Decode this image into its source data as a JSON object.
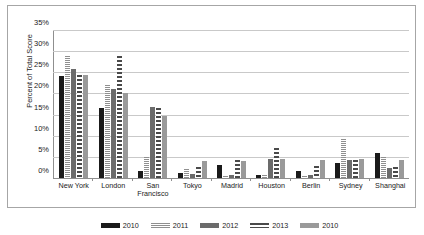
{
  "chart_data": {
    "type": "bar",
    "title": "",
    "xlabel": "",
    "ylabel": "Percent of Total Score",
    "ylim": [
      0,
      35
    ],
    "ytick_values": [
      0,
      5,
      10,
      15,
      20,
      25,
      30,
      35
    ],
    "ytick_labels": [
      "0%",
      "5%",
      "10%",
      "15%",
      "20%",
      "25%",
      "30%",
      "35%"
    ],
    "grid": true,
    "legend_position": "bottom",
    "categories": [
      "New York",
      "London",
      "San Francisco",
      "Tokyo",
      "Madrid",
      "Houston",
      "Berlin",
      "Sydney",
      "Shanghai"
    ],
    "series": [
      {
        "name": "2010",
        "color": "#1a1a1a",
        "pattern": "solid-black",
        "values": [
          24.2,
          16.7,
          1.6,
          1.3,
          3.0,
          0.8,
          1.6,
          3.5,
          6.0
        ]
      },
      {
        "name": "2011",
        "color": "#8f8f8f",
        "pattern": "fine-horizontal-hatch",
        "values": [
          29.0,
          22.1,
          5.0,
          2.2,
          0.4,
          0.6,
          0.5,
          9.4,
          5.1
        ]
      },
      {
        "name": "2012",
        "color": "#6b6b6b",
        "pattern": "solid-gray",
        "values": [
          26.0,
          21.1,
          17.0,
          1.0,
          0.6,
          4.6,
          0.6,
          4.2,
          2.5
        ]
      },
      {
        "name": "2013",
        "color": "#4a4a4a",
        "pattern": "dashed-hatch",
        "values": [
          24.6,
          29.0,
          16.7,
          2.7,
          4.3,
          7.2,
          2.8,
          4.3,
          2.6
        ]
      },
      {
        "name": "2010",
        "color": "#9a9a9a",
        "pattern": "solid-lightgray",
        "values": [
          24.6,
          20.2,
          14.8,
          4.1,
          4.1,
          4.6,
          4.3,
          4.6,
          4.2
        ]
      }
    ]
  },
  "axis": {
    "y_title": "Percent of Total Score"
  }
}
